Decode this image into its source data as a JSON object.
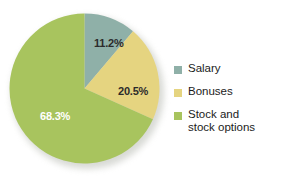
{
  "chart_data": {
    "type": "pie",
    "title": "",
    "subtitle": "",
    "xlabel": "",
    "ylabel": "",
    "grid": false,
    "legend_position": "right",
    "start_angle_oclock": 12,
    "direction": "clockwise",
    "categories": [
      "Salary",
      "Bonuses",
      "Stock and\nstock options"
    ],
    "values": [
      11.2,
      20.5,
      68.3
    ],
    "value_unit": "%",
    "colors": [
      "#8FB0A8",
      "#E5D480",
      "#A8C45E"
    ],
    "slices": [
      {
        "name": "Salary",
        "value": 11.2,
        "data_label": "11.2%",
        "color": "#8FB0A8",
        "label_color": "#2b2b2b"
      },
      {
        "name": "Bonuses",
        "value": 20.5,
        "data_label": "20.5%",
        "color": "#E5D480",
        "label_color": "#2b2b2b"
      },
      {
        "name": "Stock and stock options",
        "value": 68.3,
        "data_label": "68.3%",
        "color": "#A8C45E",
        "label_color": "#ffffff"
      }
    ]
  },
  "legend": {
    "items": [
      {
        "label": "Salary",
        "color": "#8FB0A8"
      },
      {
        "label": "Bonuses",
        "color": "#E5D480"
      },
      {
        "label": "Stock and\nstock options",
        "color": "#A8C45E"
      }
    ]
  },
  "background_color": "#ffffff"
}
